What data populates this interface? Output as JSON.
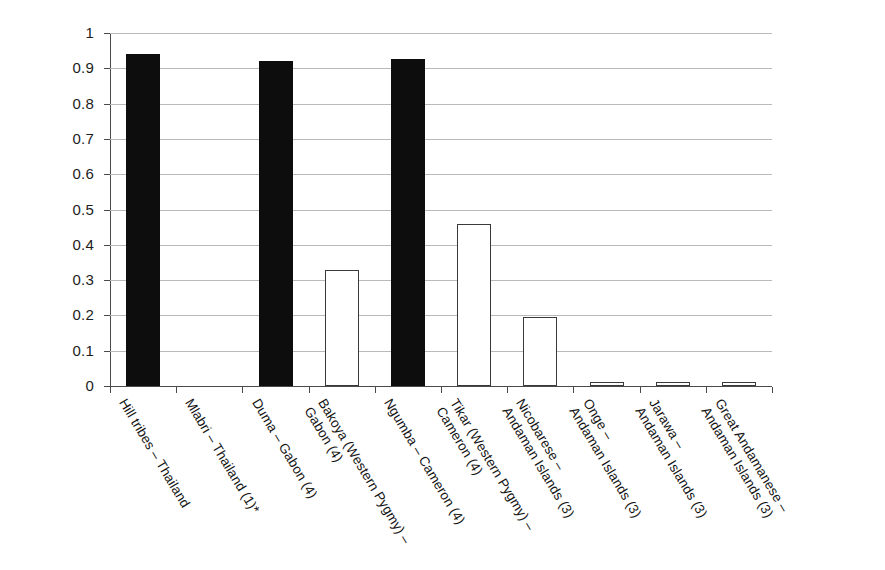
{
  "chart_data": {
    "type": "bar",
    "title": "",
    "subtitle": "",
    "xlabel": "",
    "ylabel": "Genetic Diversity",
    "ylim": [
      0,
      1
    ],
    "xlim_categories": 10,
    "grid": "horizontal",
    "legend": "none",
    "bar_styles": [
      "filled",
      "none",
      "filled",
      "hollow",
      "filled",
      "hollow",
      "hollow",
      "hollow",
      "hollow",
      "hollow"
    ],
    "categories": [
      "Hill tribes - Thailand",
      "Mlabri - Thailand (1)*",
      "Duma - Gabon (4)",
      "Bakoya (Western Pygmy) - Gabon (4)",
      "Ngumba - Cameron (4)",
      "Tikar (Western Pygmy) - Cameron (4)",
      "Nicobarese - Andaman Islands (3)",
      "Onge - Andaman Islands (3)",
      "Jarawa - Andaman Islands (3)",
      "Great Andamanese - Andaman Islands (3)"
    ],
    "category_lines": [
      [
        "Hill tribes – Thailand",
        ""
      ],
      [
        "Mlabri – Thailand (1)*",
        ""
      ],
      [
        "Duma – Gabon (4)",
        ""
      ],
      [
        "Bakoya (Western Pygmy) –",
        "Gabon (4)"
      ],
      [
        "Ngumba – Cameron (4)",
        ""
      ],
      [
        "Tikar (Western Pygmy) –",
        "Cameron (4)"
      ],
      [
        "Nicobarese –",
        "Andaman Islands (3)"
      ],
      [
        "Onge –",
        "Andaman Islands (3)"
      ],
      [
        "Jarawa –",
        "Andaman Islands (3)"
      ],
      [
        "Great Andamanese –",
        "Andaman Islands (3)"
      ]
    ],
    "values": [
      0.94,
      0,
      0.92,
      0.33,
      0.925,
      0.46,
      0.195,
      0.005,
      0.005,
      0.005
    ],
    "yticks": [
      0,
      0.1,
      0.2,
      0.3,
      0.4,
      0.5,
      0.6,
      0.7,
      0.8,
      0.9,
      1
    ],
    "ytick_labels": [
      "0",
      "0.1",
      "0.2",
      "0.3",
      "0.4",
      "0.5",
      "0.6",
      "0.7",
      "0.8",
      "0.9",
      "1"
    ]
  },
  "colors": {
    "bar_filled": "#0d0d0d",
    "bar_hollow_fill": "#ffffff",
    "bar_outline": "#3a3a3a",
    "gridline": "#b9b9b9",
    "axis": "#4a4a4a",
    "text": "#141414",
    "background": "#ffffff"
  }
}
